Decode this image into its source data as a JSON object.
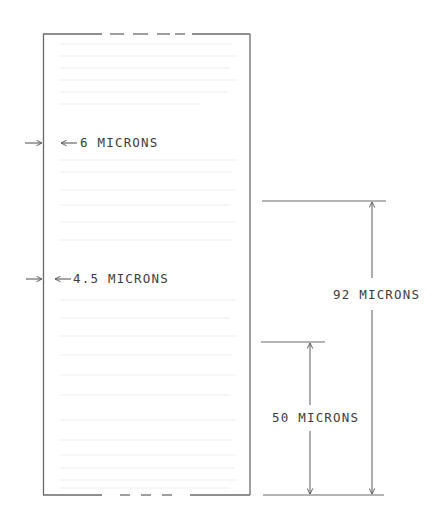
{
  "diagram": {
    "colors": {
      "line": "#6a6a6a",
      "text": "#3c3c3c",
      "ghost": "#ececec",
      "background": "#ffffff"
    },
    "specimen": {
      "label": "specimen-strip",
      "top_edge": "broken (dashed center section)",
      "bottom_edge": "broken (dashed center section)"
    },
    "left_callouts": [
      {
        "value": "6",
        "unit": "MICRONS",
        "text": "6 MICRONS"
      },
      {
        "value": "4.5",
        "unit": "MICRONS",
        "text": "4.5 MICRONS"
      }
    ],
    "dimensions": [
      {
        "value": "92",
        "unit": "MICRONS",
        "text": "92 MICRONS"
      },
      {
        "value": "50",
        "unit": "MICRONS",
        "text": "50 MICRONS"
      }
    ]
  }
}
